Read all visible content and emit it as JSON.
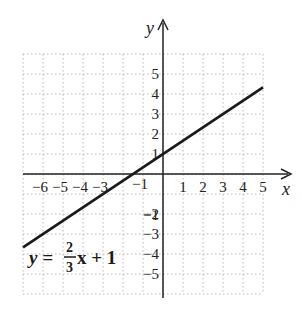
{
  "chart_data": {
    "type": "line",
    "title": "",
    "xlabel": "x",
    "ylabel": "y",
    "xlim": [
      -7,
      5
    ],
    "ylim": [
      -6,
      6
    ],
    "grid": true,
    "grid_style": "dotted",
    "x_ticks": [
      -6,
      -5,
      -4,
      -3,
      -1,
      1,
      2,
      3,
      4,
      5
    ],
    "x_tick_labels": [
      "−6",
      "−5",
      "−4",
      "−3",
      "−1",
      "1",
      "2",
      "3",
      "4",
      "5"
    ],
    "y_ticks": [
      5,
      4,
      3,
      2,
      1,
      -1,
      -2,
      -3,
      -4,
      -5
    ],
    "y_tick_labels": [
      "5",
      "4",
      "3",
      "2",
      "1",
      "−1",
      "−2",
      "−3",
      "−4",
      "−5"
    ],
    "series": [
      {
        "name": "y = 2/3 x + 1",
        "equation": "y = (2/3)x + 1",
        "slope": 0.6667,
        "intercept": 1,
        "x": [
          -7,
          5
        ],
        "y": [
          -3.67,
          4.33
        ],
        "color": "#1a1a1a"
      }
    ],
    "annotations": [
      {
        "text": "y = 2/3 x + 1",
        "position": "lower-left"
      }
    ]
  },
  "labels": {
    "x_axis": "x",
    "y_axis": "y",
    "equation_lhs": "y =",
    "equation_num": "2",
    "equation_den": "3",
    "equation_rhs": "x + 1"
  },
  "colors": {
    "axis": "#222222",
    "grid": "#b8b8b8",
    "line": "#1a1a1a",
    "background": "#ffffff"
  }
}
